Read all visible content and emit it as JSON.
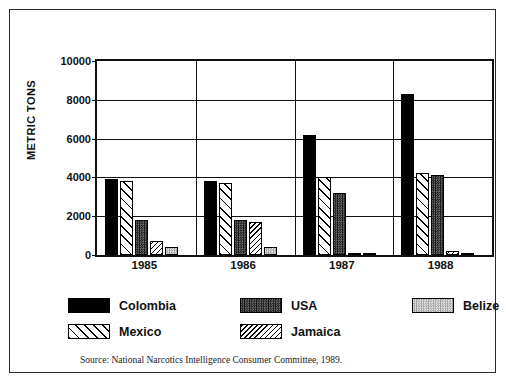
{
  "figure": {
    "border_color": "#2a2a2a",
    "background": "#ffffff"
  },
  "source_note": "Source: National Narcotics Intelligence Consumer Committee, 1989.",
  "legend": {
    "items": [
      {
        "label": "Colombia",
        "pattern": "solid-black",
        "color": "#000000"
      },
      {
        "label": "USA",
        "pattern": "stipple-dark",
        "color": "#3a3a3a"
      },
      {
        "label": "Belize",
        "pattern": "stipple-light",
        "color": "#d9d9d9"
      },
      {
        "label": "Mexico",
        "pattern": "hatch-wide",
        "color": "#ffffff"
      },
      {
        "label": "Jamaica",
        "pattern": "hatch-narrow",
        "color": "#ffffff"
      }
    ]
  },
  "chart_data": {
    "type": "bar",
    "title": "",
    "xlabel": "",
    "ylabel": "METRIC TONS",
    "categories": [
      "1985",
      "1986",
      "1987",
      "1988"
    ],
    "ylim": [
      0,
      10000
    ],
    "yticks": [
      0,
      2000,
      4000,
      6000,
      8000,
      10000
    ],
    "ytick_labels": [
      "0",
      "2000",
      "4000",
      "6000",
      "8000",
      "10000"
    ],
    "grid": true,
    "legend_position": "below-plot",
    "series": [
      {
        "name": "Colombia",
        "pattern": "solid-black",
        "values": [
          3900,
          3800,
          6200,
          8300
        ]
      },
      {
        "name": "Mexico",
        "pattern": "hatch-wide",
        "values": [
          3800,
          3700,
          4000,
          4250
        ]
      },
      {
        "name": "USA",
        "pattern": "stipple-dark",
        "values": [
          1800,
          1800,
          3200,
          4150
        ]
      },
      {
        "name": "Jamaica",
        "pattern": "hatch-narrow",
        "values": [
          700,
          1700,
          80,
          200
        ]
      },
      {
        "name": "Belize",
        "pattern": "stipple-light",
        "values": [
          400,
          400,
          50,
          60
        ]
      }
    ]
  }
}
